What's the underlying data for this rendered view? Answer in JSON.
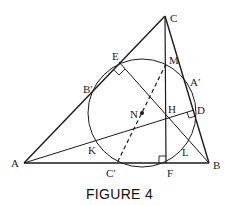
{
  "figure": {
    "caption": "FIGURE 4",
    "points": {
      "A": {
        "label": "A",
        "x": 24,
        "y": 163
      },
      "B": {
        "label": "B",
        "x": 209,
        "y": 163
      },
      "C": {
        "label": "C",
        "x": 165,
        "y": 16
      },
      "E": {
        "label": "E",
        "x": 119,
        "y": 62
      },
      "B_prime": {
        "label": "B′",
        "x": 93,
        "y": 87
      },
      "M": {
        "label": "M",
        "x": 166,
        "y": 64
      },
      "A_prime": {
        "label": "A′",
        "x": 187,
        "y": 87
      },
      "D": {
        "label": "D",
        "x": 194,
        "y": 110
      },
      "N": {
        "label": "N",
        "x": 142,
        "y": 113
      },
      "H": {
        "label": "H",
        "x": 166,
        "y": 118
      },
      "K": {
        "label": "K",
        "x": 88,
        "y": 142
      },
      "L": {
        "label": "L",
        "x": 186,
        "y": 140
      },
      "C_prime": {
        "label": "C′",
        "x": 117,
        "y": 164
      },
      "F": {
        "label": "F",
        "x": 166,
        "y": 164
      }
    },
    "circle": {
      "name": "nine-point circle",
      "cx": 142,
      "cy": 113,
      "r": 54
    },
    "stroke_color": "#1a1a1a"
  }
}
